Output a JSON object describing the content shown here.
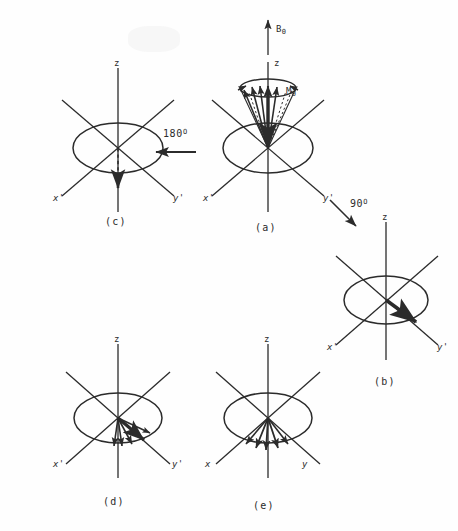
{
  "figure": {
    "ink_color": "#2b2b2b",
    "background_color": "#fefefe",
    "width": 458,
    "height": 531
  },
  "panels": [
    {
      "id": "a",
      "label": "(a)",
      "description": "Equilibrium magnetization precessing about B0 on a cone around z",
      "axes": {
        "z": "z",
        "x": "x'",
        "y": "y'"
      },
      "vectors": [
        {
          "name": "B0",
          "base": "B",
          "subscript": "0"
        },
        {
          "name": "M0",
          "base": "M",
          "subscript": "0"
        }
      ]
    },
    {
      "id": "b",
      "label": "(b)",
      "description": "Magnetization tipped into the transverse plane along y'",
      "axes": {
        "z": "z",
        "x": "x'",
        "y": "y'"
      }
    },
    {
      "id": "c",
      "label": "(c)",
      "description": "Magnetization inverted along negative z after 180 degree pulse",
      "axes": {
        "z": "z",
        "x": "x'",
        "y": "y'"
      }
    },
    {
      "id": "d",
      "label": "(d)",
      "description": "Isochromats dephasing in the transverse plane",
      "axes": {
        "z": "z",
        "x": "x'",
        "y": "y'"
      }
    },
    {
      "id": "e",
      "label": "(e)",
      "description": "Isochromats refocusing in the transverse plane",
      "axes": {
        "z": "z",
        "x": "x",
        "y": "y"
      }
    }
  ],
  "transitions": [
    {
      "id": "pulse-180",
      "value": "180",
      "unit": "O",
      "direction": "left",
      "from_panel": "a",
      "to_panel": "c"
    },
    {
      "id": "pulse-90",
      "value": "90",
      "unit": "O",
      "direction": "down-right",
      "from_panel": "a",
      "to_panel": "b"
    }
  ]
}
